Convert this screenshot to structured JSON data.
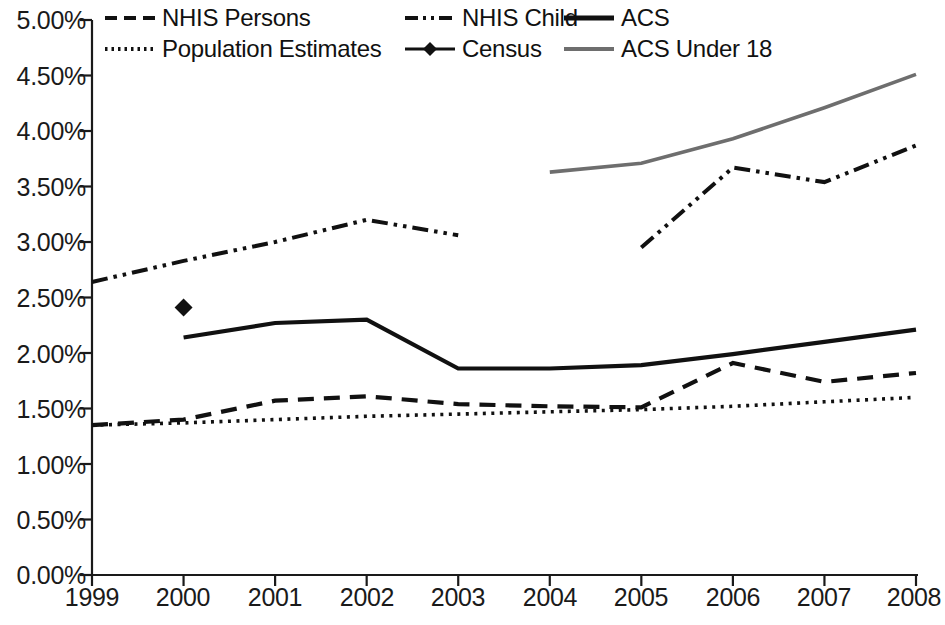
{
  "chart_data": {
    "type": "line",
    "title": "",
    "xlabel": "",
    "ylabel": "",
    "x": [
      1999,
      2000,
      2001,
      2002,
      2003,
      2004,
      2005,
      2006,
      2007,
      2008
    ],
    "xtick_labels": [
      "1999",
      "2000",
      "2001",
      "2002",
      "2003",
      "2004",
      "2005",
      "2006",
      "2007",
      "2008"
    ],
    "ytick_labels": [
      "0.00%",
      "0.50%",
      "1.00%",
      "1.50%",
      "2.00%",
      "2.50%",
      "3.00%",
      "3.50%",
      "4.00%",
      "4.50%",
      "5.00%"
    ],
    "ytick_values": [
      0.0,
      0.5,
      1.0,
      1.5,
      2.0,
      2.5,
      3.0,
      3.5,
      4.0,
      4.5,
      5.0
    ],
    "ylim": [
      0.0,
      5.0
    ],
    "xlim": [
      1999,
      2008
    ],
    "grid": false,
    "legend_position": "top-inside",
    "series": [
      {
        "name": "NHIS Persons",
        "style": "dashed",
        "color": "#111111",
        "x": [
          1999,
          2000,
          2001,
          2002,
          2003,
          2004,
          2005,
          2006,
          2007,
          2008
        ],
        "values": [
          1.35,
          1.4,
          1.57,
          1.61,
          1.54,
          1.52,
          1.51,
          1.91,
          1.74,
          1.82
        ]
      },
      {
        "name": "Population Estimates",
        "style": "dotted",
        "color": "#111111",
        "x": [
          1999,
          2000,
          2001,
          2002,
          2003,
          2004,
          2005,
          2006,
          2007,
          2008
        ],
        "values": [
          1.35,
          1.37,
          1.4,
          1.43,
          1.45,
          1.47,
          1.49,
          1.52,
          1.56,
          1.6
        ]
      },
      {
        "name": "NHIS Child",
        "style": "dash-dot-dot",
        "color": "#111111",
        "x": [
          1999,
          2000,
          2001,
          2002,
          2003,
          2005,
          2006,
          2007,
          2008
        ],
        "values": [
          2.64,
          2.83,
          3.0,
          3.2,
          3.06,
          2.95,
          3.67,
          3.54,
          3.87
        ],
        "gap_between": [
          2003,
          2005
        ]
      },
      {
        "name": "ACS",
        "style": "solid",
        "color": "#111111",
        "x": [
          2000,
          2001,
          2002,
          2003,
          2004,
          2005,
          2006,
          2007,
          2008
        ],
        "values": [
          2.14,
          2.27,
          2.3,
          1.86,
          1.86,
          1.89,
          1.99,
          2.1,
          2.21
        ]
      },
      {
        "name": "Census",
        "style": "marker-diamond",
        "color": "#111111",
        "x": [
          2000
        ],
        "values": [
          2.41
        ]
      },
      {
        "name": "ACS Under 18",
        "style": "solid-gray",
        "color": "#6e6e6e",
        "x": [
          2004,
          2005,
          2006,
          2007,
          2008
        ],
        "values": [
          3.63,
          3.71,
          3.93,
          4.21,
          4.51
        ]
      }
    ],
    "legend_entries": [
      {
        "label": "NHIS Persons",
        "style": "dashed",
        "color": "#111111"
      },
      {
        "label": "NHIS Child",
        "style": "dash-dot-dot",
        "color": "#111111"
      },
      {
        "label": "ACS",
        "style": "solid",
        "color": "#111111"
      },
      {
        "label": "Population Estimates",
        "style": "dotted",
        "color": "#111111"
      },
      {
        "label": "Census",
        "style": "marker-diamond-line",
        "color": "#111111"
      },
      {
        "label": "ACS Under 18",
        "style": "solid-gray",
        "color": "#6e6e6e"
      }
    ]
  }
}
